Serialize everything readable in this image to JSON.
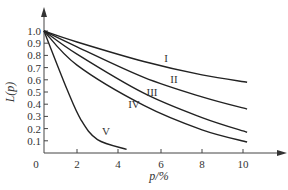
{
  "chart_data": {
    "type": "line",
    "title": "",
    "xlabel": "p/%",
    "ylabel": "L(p)",
    "xlim": [
      0,
      11
    ],
    "ylim": [
      0,
      1.1
    ],
    "grid": false,
    "legend": "inline curve labels",
    "x_ticks": [
      "0",
      "2",
      "4",
      "6",
      "8",
      "10"
    ],
    "y_ticks": [
      "0.1",
      "0.2",
      "0.3",
      "0.4",
      "0.5",
      "0.6",
      "0.7",
      "0.8",
      "0.9",
      "1.0"
    ],
    "series": [
      {
        "name": "I",
        "x": [
          0,
          2,
          5.2,
          8,
          10.2
        ],
        "values": [
          1.0,
          0.91,
          0.75,
          0.64,
          0.58
        ]
      },
      {
        "name": "II",
        "x": [
          0,
          2,
          5.2,
          8,
          10.2
        ],
        "values": [
          1.0,
          0.87,
          0.62,
          0.46,
          0.36
        ]
      },
      {
        "name": "III",
        "x": [
          0,
          2,
          5.2,
          8,
          10.2
        ],
        "values": [
          1.0,
          0.81,
          0.49,
          0.29,
          0.17
        ]
      },
      {
        "name": "IV",
        "x": [
          0,
          2,
          5.2,
          8,
          10.2
        ],
        "values": [
          1.0,
          0.72,
          0.39,
          0.19,
          0.09
        ]
      },
      {
        "name": "V",
        "x": [
          0,
          1.4,
          2.2,
          3.0,
          4.4
        ],
        "values": [
          1.0,
          0.52,
          0.27,
          0.11,
          0.03
        ]
      }
    ]
  },
  "labels": {
    "origin": "0",
    "xlabel": "p/%",
    "ylabel": "L(p)",
    "curves": [
      "I",
      "II",
      "III",
      "IV",
      "V"
    ]
  }
}
